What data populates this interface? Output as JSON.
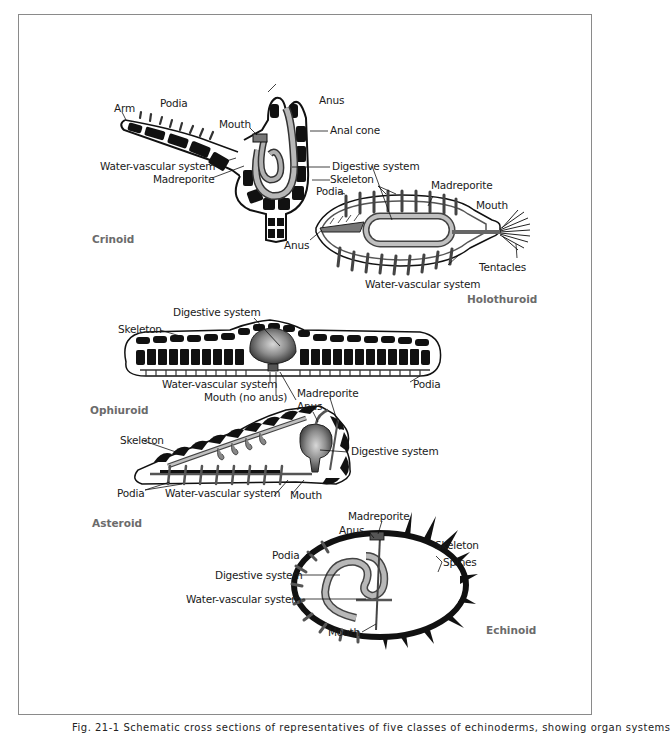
{
  "figure": {
    "caption": "Fig. 21-1 Schematic cross sections of representatives of five classes of echinoderms, showing organ systems",
    "colors": {
      "frame": "#8a8a8a",
      "ink": "#111111",
      "gut_dark": "#555555",
      "gut_light": "#b5b5b5",
      "class_label": "#6b6b6b"
    }
  },
  "crinoid": {
    "title": "Crinoid",
    "labels": {
      "arm": "Arm",
      "podia": "Podia",
      "mouth": "Mouth",
      "anus": "Anus",
      "anal_cone": "Anal cone",
      "water_vascular": "Water-vascular system",
      "madreporite": "Madreporite",
      "digestive": "Digestive system",
      "skeleton": "Skeleton"
    }
  },
  "holothuroid": {
    "title": "Holothuroid",
    "labels": {
      "podia": "Podia",
      "madreporite": "Madreporite",
      "mouth": "Mouth",
      "anus": "Anus",
      "tentacles": "Tentacles",
      "water_vascular": "Water-vascular system"
    }
  },
  "ophiuroid": {
    "title": "Ophiuroid",
    "labels": {
      "digestive": "Digestive system",
      "skeleton": "Skeleton",
      "water_vascular": "Water-vascular system",
      "mouth": "Mouth (no anus)",
      "madreporite": "Madreporite",
      "podia": "Podia"
    }
  },
  "asteroid": {
    "title": "Asteroid",
    "labels": {
      "anus": "Anus",
      "skeleton": "Skeleton",
      "digestive": "Digestive system",
      "podia": "Podia",
      "water_vascular": "Water-vascular system",
      "mouth": "Mouth"
    }
  },
  "echinoid": {
    "title": "Echinoid",
    "labels": {
      "madreporite": "Madreporite",
      "anus": "Anus",
      "skeleton": "Skeleton",
      "podia": "Podia",
      "spines": "Spines",
      "digestive": "Digestive system",
      "water_vascular": "Water-vascular system",
      "mouth": "Mouth"
    }
  }
}
